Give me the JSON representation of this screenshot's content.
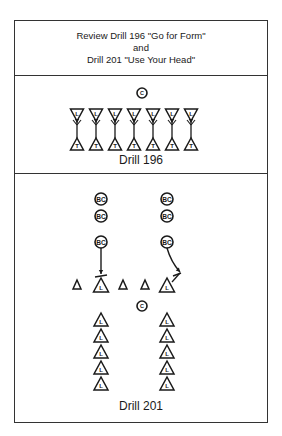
{
  "header": {
    "line1": "Review Drill 196 \"Go for Form\"",
    "line2": "and",
    "line3": "Drill 201 \"Use Your Head\""
  },
  "drill196": {
    "caption": "Drill 196",
    "coach_label": "C",
    "pairs": 7,
    "top_player_label": "L",
    "bottom_player_label": "T"
  },
  "drill201": {
    "caption": "Drill 201",
    "coach_label": "C",
    "ball_carrier_label": "BC",
    "lineman_label": "L",
    "ball_carrier_columns": 2,
    "ball_carriers_per_column": 3,
    "cones": 4,
    "lineman_columns": 2,
    "linemen_per_column": 5
  },
  "colors": {
    "stroke": "#1a1a1a",
    "border": "#333333",
    "background": "#ffffff"
  }
}
